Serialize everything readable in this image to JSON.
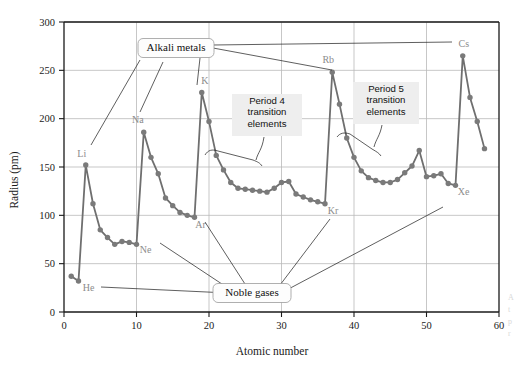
{
  "figure": {
    "name": "atomic-radius-vs-atomic-number",
    "edge_caption_lines": [
      "A",
      "t",
      "p",
      "r"
    ]
  },
  "chart_data": {
    "type": "line",
    "title": "",
    "xlabel": "Atomic number",
    "ylabel": "Radius (pm)",
    "xlim": [
      0,
      60
    ],
    "ylim": [
      0,
      300
    ],
    "xticks": [
      0,
      10,
      20,
      30,
      40,
      50,
      60
    ],
    "yticks": [
      0,
      50,
      100,
      150,
      200,
      250,
      300
    ],
    "grid": true,
    "legend_position": "none",
    "marker": "circle",
    "line_color": "#6f6f6f",
    "marker_color": "#7a7a7a",
    "series": [
      {
        "name": "Atomic radius",
        "x": [
          1,
          2,
          3,
          4,
          5,
          6,
          7,
          8,
          9,
          10,
          11,
          12,
          13,
          14,
          15,
          16,
          17,
          18,
          19,
          20,
          21,
          22,
          23,
          24,
          25,
          26,
          27,
          28,
          29,
          30,
          31,
          32,
          33,
          34,
          35,
          36,
          37,
          38,
          39,
          40,
          41,
          42,
          43,
          44,
          45,
          46,
          47,
          48,
          49,
          50,
          51,
          52,
          53,
          54,
          55,
          56,
          57,
          58
        ],
        "values": [
          37,
          32,
          152,
          112,
          85,
          77,
          70,
          73,
          72,
          70,
          186,
          160,
          143,
          118,
          110,
          103,
          100,
          98,
          227,
          197,
          162,
          147,
          134,
          128,
          127,
          126,
          125,
          124,
          128,
          134,
          135,
          122,
          119,
          116,
          114,
          112,
          248,
          215,
          180,
          160,
          146,
          139,
          136,
          134,
          134,
          137,
          144,
          151,
          167,
          140,
          141,
          143,
          133,
          131,
          265,
          222,
          197,
          169
        ]
      }
    ],
    "element_labels": [
      {
        "symbol": "He",
        "atomic_number": 2,
        "radius": 32,
        "dx": 10,
        "dy": 10
      },
      {
        "symbol": "Li",
        "atomic_number": 3,
        "radius": 152,
        "dx": -4,
        "dy": -8
      },
      {
        "symbol": "Ne",
        "atomic_number": 10,
        "radius": 70,
        "dx": 9,
        "dy": 9
      },
      {
        "symbol": "Na",
        "atomic_number": 11,
        "radius": 186,
        "dx": -6,
        "dy": -9
      },
      {
        "symbol": "Ar",
        "atomic_number": 18,
        "radius": 98,
        "dx": 6,
        "dy": 11
      },
      {
        "symbol": "K",
        "atomic_number": 19,
        "radius": 227,
        "dx": 3,
        "dy": -9
      },
      {
        "symbol": "Kr",
        "atomic_number": 36,
        "radius": 112,
        "dx": 8,
        "dy": 10
      },
      {
        "symbol": "Rb",
        "atomic_number": 37,
        "radius": 248,
        "dx": -4,
        "dy": -9
      },
      {
        "symbol": "Xe",
        "atomic_number": 54,
        "radius": 131,
        "dx": 8,
        "dy": 10
      },
      {
        "symbol": "Cs",
        "atomic_number": 55,
        "radius": 265,
        "dx": 1,
        "dy": -9
      }
    ],
    "annotations": [
      {
        "id": "alkali-metals",
        "text": "Alkali metals",
        "style": "rounded-box",
        "lines": [
          "Alkali metals"
        ]
      },
      {
        "id": "noble-gases",
        "text": "Noble gases",
        "style": "rounded-box",
        "lines": [
          "Noble gases"
        ]
      },
      {
        "id": "period-4",
        "text": "Period 4 transition elements",
        "style": "plain-box",
        "lines": [
          "Period 4",
          "transition",
          "elements"
        ]
      },
      {
        "id": "period-5",
        "text": "Period 5 transition elements",
        "style": "plain-box",
        "lines": [
          "Period 5",
          "transition",
          "elements"
        ]
      }
    ]
  }
}
